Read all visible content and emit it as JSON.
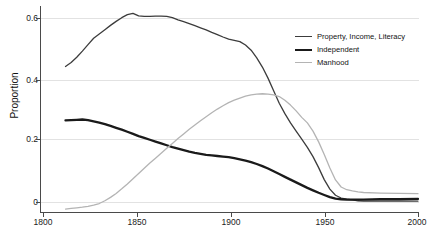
{
  "chart_data": {
    "type": "line",
    "title": "",
    "xlabel": "",
    "ylabel": "Proportion",
    "xlim": [
      1800,
      2000
    ],
    "ylim": [
      -0.035,
      0.645
    ],
    "grid": true,
    "legend_position": "top-right",
    "xticks": [
      1800,
      1850,
      1900,
      1950,
      2000
    ],
    "xtick_labels": [
      "1800",
      "1850",
      "1900",
      "1950",
      "2000"
    ],
    "yticks": [
      0,
      0.2,
      0.4,
      0.6
    ],
    "ytick_labels": [
      "0",
      "0.2",
      "0.4",
      "0.6"
    ],
    "series": [
      {
        "name": "Property, Income, Literacy",
        "color": "#3c3c3c",
        "width": 1.3,
        "x": [
          1812,
          1815,
          1818,
          1821,
          1824,
          1827,
          1830,
          1833,
          1836,
          1839,
          1842,
          1845,
          1848,
          1851,
          1854,
          1857,
          1860,
          1863,
          1866,
          1869,
          1872,
          1875,
          1878,
          1881,
          1884,
          1887,
          1890,
          1893,
          1896,
          1899,
          1902,
          1905,
          1908,
          1911,
          1914,
          1917,
          1920,
          1923,
          1926,
          1929,
          1932,
          1935,
          1938,
          1941,
          1944,
          1947,
          1950,
          1953,
          1956,
          1959,
          1962,
          1965,
          1968,
          1971,
          1980,
          1990,
          2000
        ],
        "y": [
          0.442,
          0.455,
          0.472,
          0.492,
          0.513,
          0.534,
          0.548,
          0.562,
          0.576,
          0.589,
          0.601,
          0.611,
          0.615,
          0.607,
          0.605,
          0.605,
          0.606,
          0.606,
          0.605,
          0.601,
          0.594,
          0.588,
          0.582,
          0.575,
          0.568,
          0.561,
          0.553,
          0.546,
          0.538,
          0.531,
          0.527,
          0.523,
          0.512,
          0.495,
          0.47,
          0.44,
          0.404,
          0.363,
          0.322,
          0.288,
          0.258,
          0.231,
          0.205,
          0.178,
          0.148,
          0.112,
          0.073,
          0.042,
          0.022,
          0.013,
          0.009,
          0.007,
          0.004,
          0.003,
          0.003,
          0.003,
          0.003
        ]
      },
      {
        "name": "Independent",
        "color": "#1a1a1a",
        "width": 2.3,
        "x": [
          1812,
          1815,
          1818,
          1821,
          1824,
          1827,
          1830,
          1833,
          1836,
          1839,
          1842,
          1845,
          1848,
          1851,
          1854,
          1857,
          1860,
          1863,
          1866,
          1869,
          1872,
          1875,
          1878,
          1881,
          1884,
          1887,
          1890,
          1893,
          1896,
          1899,
          1902,
          1905,
          1908,
          1911,
          1914,
          1917,
          1920,
          1923,
          1926,
          1929,
          1932,
          1935,
          1938,
          1941,
          1944,
          1947,
          1950,
          1953,
          1956,
          1959,
          1962,
          1965,
          1968,
          1971,
          1980,
          1990,
          2000
        ],
        "y": [
          0.266,
          0.267,
          0.268,
          0.269,
          0.267,
          0.263,
          0.259,
          0.254,
          0.248,
          0.242,
          0.236,
          0.229,
          0.222,
          0.215,
          0.209,
          0.203,
          0.197,
          0.191,
          0.185,
          0.179,
          0.174,
          0.169,
          0.164,
          0.16,
          0.157,
          0.154,
          0.152,
          0.15,
          0.148,
          0.146,
          0.143,
          0.139,
          0.135,
          0.13,
          0.124,
          0.117,
          0.109,
          0.1,
          0.091,
          0.082,
          0.073,
          0.064,
          0.055,
          0.046,
          0.038,
          0.03,
          0.023,
          0.016,
          0.011,
          0.009,
          0.008,
          0.008,
          0.008,
          0.008,
          0.009,
          0.009,
          0.01
        ]
      },
      {
        "name": "Manhood",
        "color": "#b4b4b4",
        "width": 1.3,
        "x": [
          1812,
          1815,
          1818,
          1821,
          1824,
          1827,
          1830,
          1833,
          1836,
          1839,
          1842,
          1845,
          1848,
          1851,
          1854,
          1857,
          1860,
          1863,
          1866,
          1869,
          1872,
          1875,
          1878,
          1881,
          1884,
          1887,
          1890,
          1893,
          1896,
          1899,
          1902,
          1905,
          1908,
          1911,
          1914,
          1917,
          1920,
          1923,
          1926,
          1929,
          1932,
          1935,
          1938,
          1941,
          1944,
          1947,
          1950,
          1953,
          1956,
          1959,
          1962,
          1965,
          1968,
          1971,
          1980,
          1990,
          2000
        ],
        "y": [
          -0.023,
          -0.021,
          -0.019,
          -0.017,
          -0.014,
          -0.01,
          -0.005,
          0.004,
          0.015,
          0.028,
          0.043,
          0.059,
          0.076,
          0.093,
          0.11,
          0.127,
          0.143,
          0.159,
          0.175,
          0.191,
          0.207,
          0.222,
          0.237,
          0.251,
          0.265,
          0.278,
          0.291,
          0.303,
          0.314,
          0.324,
          0.332,
          0.339,
          0.345,
          0.349,
          0.352,
          0.353,
          0.352,
          0.349,
          0.344,
          0.332,
          0.316,
          0.297,
          0.276,
          0.258,
          0.231,
          0.196,
          0.155,
          0.111,
          0.072,
          0.049,
          0.04,
          0.036,
          0.033,
          0.031,
          0.029,
          0.028,
          0.027
        ]
      }
    ]
  },
  "axes": {
    "ylabel": "Proportion",
    "ytick_labels": [
      "0.6",
      "0.4",
      "0.2",
      "0"
    ],
    "xtick_labels": [
      "1800",
      "1850",
      "1900",
      "1950",
      "2000"
    ]
  },
  "legend": {
    "items": [
      {
        "label": "Property, Income, Literacy"
      },
      {
        "label": "Independent"
      },
      {
        "label": "Manhood"
      }
    ]
  }
}
